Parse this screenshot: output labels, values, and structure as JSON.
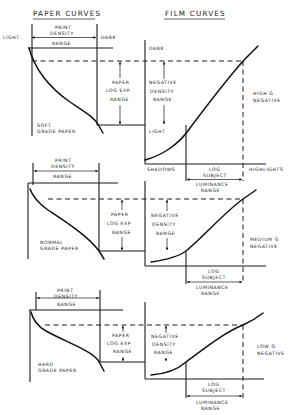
{
  "titles": {
    "paper": "PAPER CURVES",
    "film": "FILM CURVES"
  },
  "labels": {
    "light": "LIGHT",
    "dark": "DARK",
    "print_density_range": [
      "PRINT",
      "DENSITY",
      "RANGE"
    ],
    "paper_log_exp_range": [
      "PAPER",
      "LOG  EXP",
      "RANGE"
    ],
    "negative_density_range": [
      "NEGATIVE",
      "DENSITY",
      "RANGE"
    ],
    "log_subject_luminance_range": [
      "LOG",
      "SUBJECT",
      "LUMINANCE",
      "RANGE"
    ],
    "shadows": "SHADOWS",
    "highlights": "HIGHLIGHTS"
  },
  "panels": [
    {
      "paper_grade": [
        "SOFT",
        "GRADE PAPER"
      ],
      "film_negative": [
        "HIGH Ġ",
        "NEGATIVE"
      ]
    },
    {
      "paper_grade": [
        "NORMAL",
        "GRADE PAPER"
      ],
      "film_negative": [
        "MEDIUM Ġ",
        "NEGATIVE"
      ]
    },
    {
      "paper_grade": [
        "HARD",
        "GRADE PAPER"
      ],
      "film_negative": [
        "LOW Ġ",
        "NEGATIVE"
      ]
    }
  ],
  "colors": {
    "ink": "#1a1a1a",
    "background": "#ffffff"
  }
}
